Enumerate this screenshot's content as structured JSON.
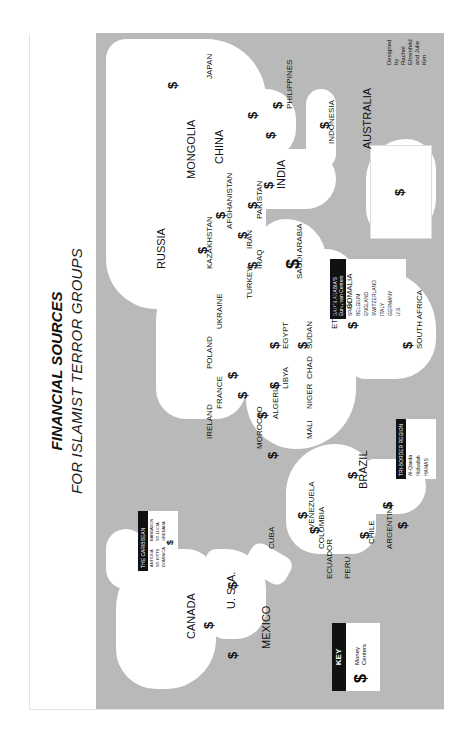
{
  "title": "FINANCIAL SOURCES",
  "subtitle": "FOR ISLAMIST TERROR GROUPS",
  "colors": {
    "ocean": "#b9b9b9",
    "land": "#ffffff",
    "ink": "#111111"
  },
  "orientation": "map rotated 90 degrees counter-clockwise (north points left)",
  "key": {
    "heading": "KEY",
    "symbol": "$",
    "label_line1": "Money",
    "label_line2": "Centers"
  },
  "credit": {
    "line1": "Designed by",
    "line2": "Rachel Ehrenfeld",
    "line3": "and Julie Kim"
  },
  "caribbean_inset": {
    "heading": "THE CARIBBEAN",
    "items": [
      "ANTIGUA",
      "ST. KITTS",
      "DOMINICA",
      "BARBADOS",
      "ST. LUCIA",
      "GRENADA",
      "ST. VINCENT & THE GRENADINES",
      "TRINIDAD & TOBAGO",
      "NETHERLANDS ANTILLES"
    ]
  },
  "saudi_box": {
    "heading_line1": "SAUDI ARABIA'S",
    "heading_line2": "European Centers",
    "items": [
      "SPAIN",
      "BELGIUM",
      "ENGLAND",
      "SWITZERLAND",
      "ITALY",
      "GERMANY",
      "U.S."
    ]
  },
  "triborder_box": {
    "heading": "TRI-BORDER REGION",
    "items": [
      "Al-Qaeda",
      "Hizballah",
      "HAMAS",
      "Other Islamist Terror Groups"
    ]
  },
  "major_labels": {
    "canada": "CANADA",
    "usa": "U. S. A.",
    "mexico": "MEXICO",
    "cuba": "CUBA",
    "venezuela": "VENEZUELA",
    "colombia": "COLOMBIA",
    "ecuador": "ECUADOR",
    "peru": "PERU",
    "brazil": "BRAZIL",
    "bolivia": "BOLIVIA",
    "paraguay": "PARAGUAY",
    "chile": "CHILE",
    "argentina": "ARGENTINA",
    "uruguay": "URUGUAY",
    "ireland": "IRELAND",
    "poland": "POLAND",
    "ukraine": "UKRAINE",
    "france": "FRANCE",
    "portugal": "PORTUGAL",
    "greece": "GREECE",
    "turkey": "TURKEY",
    "morocco": "MOROCCO",
    "algeria": "ALGERIA",
    "libya": "LIBYA",
    "egypt": "EGYPT",
    "mauritania": "MAURITANIA",
    "mali": "MALI",
    "niger": "NIGER",
    "chad": "CHAD",
    "sudan": "SUDAN",
    "ethiopia": "ETHIOPIA",
    "somalia": "SOMALIA",
    "south_africa": "SOUTH AFRICA",
    "russia": "RUSSIA",
    "kazakhstan": "KAZAKHSTAN",
    "iran": "IRAN",
    "iraq": "IRAQ",
    "saudi_arabia": "SAUDI ARABIA",
    "afghanistan": "AFGHANISTAN",
    "pakistan": "PAKISTAN",
    "india": "INDIA",
    "mongolia": "MONGOLIA",
    "china": "CHINA",
    "japan": "JAPAN",
    "north_korea": "NORTH KOREA",
    "south_korea": "SOUTH KOREA",
    "philippines": "PHILIPPINES",
    "hong_kong": "HONG KONG",
    "indonesia": "INDONESIA",
    "australia": "AUSTRALIA",
    "uzbekistan": "UZBEKISTAN",
    "kyrgyzstan": "KYRGYZSTAN",
    "tajikistan": "TAJIKISTAN",
    "turkmenistan": "TURKMENISTAN",
    "syria": "SYRIA",
    "lebanon": "LEBANON",
    "israel": "ISRAEL",
    "jordan": "JORDAN",
    "kuwait": "KUWAIT",
    "uae": "U.A.E.",
    "oman": "OMAN",
    "yemen": "YEMEN",
    "thailand": "THAILAND",
    "vietnam": "VIETNAM",
    "cambodia": "KAMPUCHEA",
    "malaysia": "MALAYSIA",
    "singapore": "SINGAPORE",
    "sri_lanka": "SRI LANKA",
    "nepal": "NEPAL",
    "bhutan": "BHUTAN",
    "bangladesh": "BANGLADESH",
    "myanmar": "MYANMAR",
    "laos": "LAOS",
    "taiwan": "TAIWAN",
    "kenya": "KENYA",
    "tanzania": "TANZANIA",
    "nigeria": "NIGERIA",
    "angola": "ANGOLA",
    "zambia": "ZAMBIA",
    "namibia": "NAMIBIA",
    "botswana": "BOTSWANA",
    "mozambique": "MOZAMBIQUE",
    "madagascar": "MADAGASCAR",
    "new_zealand": "NEW ZEALAND",
    "guyana": "GUYANA",
    "suriname": "SURINAME",
    "haiti": "HAITI",
    "jamaica": "JAMAICA",
    "panama": "PANAMA",
    "guatemala": "GUATEMALA",
    "honduras": "HONDURAS",
    "nicaragua": "NICARAGUA",
    "costa_rica": "COSTA RICA",
    "el_salvador": "EL SALVADOR",
    "belize": "BELIZE",
    "dominican_republic": "DOMINICAN REPUBLIC",
    "senegal": "SENEGAL",
    "ivory_coast": "IVORY COAST",
    "liberia": "LIBERIA",
    "sierra_leone": "SIERRA LEONE",
    "cameroon": "CAMEROON",
    "uganda": "UGANDA",
    "somaliland": "DJIBOUTI",
    "eritrea": "ERITREA"
  },
  "money_center_symbol": "$"
}
